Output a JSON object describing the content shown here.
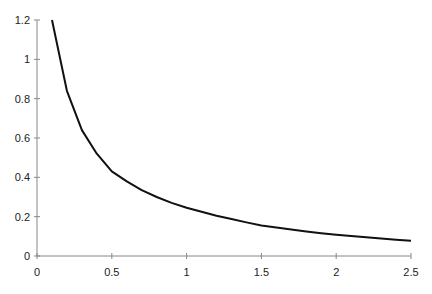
{
  "chart_data": {
    "type": "line",
    "title": "",
    "xlabel": "",
    "ylabel": "",
    "xlim": [
      0,
      2.5
    ],
    "ylim": [
      0,
      1.2
    ],
    "grid": false,
    "legend": null,
    "x_ticks": [
      "0",
      "0.5",
      "1",
      "1.5",
      "2",
      "2.5"
    ],
    "y_ticks": [
      "0",
      "0.2",
      "0.4",
      "0.6",
      "0.8",
      "1",
      "1.2"
    ],
    "series": [
      {
        "name": "curve",
        "color": "#111111",
        "x": [
          0.1,
          0.2,
          0.3,
          0.4,
          0.5,
          0.6,
          0.7,
          0.8,
          0.9,
          1.0,
          1.1,
          1.2,
          1.3,
          1.4,
          1.5,
          1.6,
          1.7,
          1.8,
          1.9,
          2.0,
          2.1,
          2.2,
          2.3,
          2.4,
          2.5
        ],
        "values": [
          1.2,
          0.84,
          0.64,
          0.52,
          0.43,
          0.38,
          0.335,
          0.3,
          0.27,
          0.245,
          0.225,
          0.205,
          0.188,
          0.171,
          0.155,
          0.145,
          0.135,
          0.125,
          0.116,
          0.108,
          0.101,
          0.095,
          0.089,
          0.083,
          0.078
        ]
      }
    ]
  },
  "axis": {
    "color": "#888888"
  }
}
